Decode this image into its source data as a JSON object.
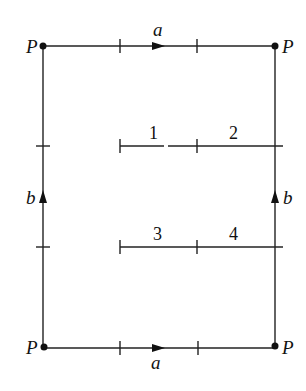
{
  "diagram": {
    "type": "square-identification-polygon",
    "corners": [
      {
        "id": "top-left",
        "label": "P"
      },
      {
        "id": "top-right",
        "label": "P"
      },
      {
        "id": "bottom-left",
        "label": "P"
      },
      {
        "id": "bottom-right",
        "label": "P"
      }
    ],
    "edges": {
      "top": {
        "label": "a",
        "direction": "right"
      },
      "bottom": {
        "label": "a",
        "direction": "right"
      },
      "left": {
        "label": "b",
        "direction": "up"
      },
      "right": {
        "label": "b",
        "direction": "up"
      }
    },
    "segments": [
      {
        "label": "1"
      },
      {
        "label": "2"
      },
      {
        "label": "3"
      },
      {
        "label": "4"
      }
    ],
    "colors": {
      "ink": "#111111",
      "background": "#ffffff"
    }
  }
}
